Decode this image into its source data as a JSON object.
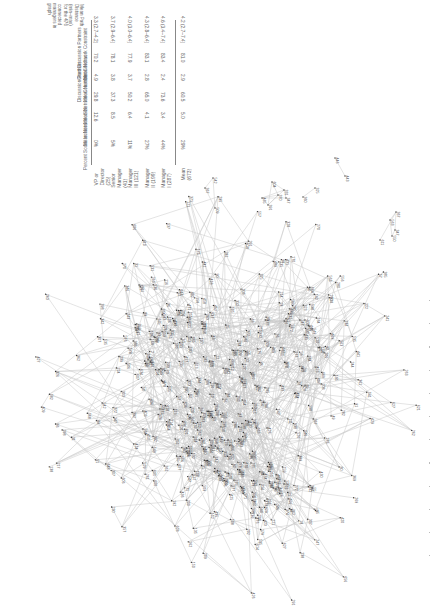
{
  "figure": {
    "orientation": "rotated-90-ccw",
    "table": {
      "columns": [
        "Percent Social Isolates",
        "Mean Network Size",
        "Mean Network Constraint",
        "Mean Number Cited as Discussion Partners",
        "Mean Network Constraint Cited Discussion Partners",
        "Mean Path Distance (min–max) for the 476 connected managers in graph"
      ],
      "column_lines": [
        [
          "Percent Social Isolates"
        ],
        [
          "Mean Network Size"
        ],
        [
          "Mean Network Constraint"
        ],
        [
          "Mean Number Cited as",
          "Discussion Partners"
        ],
        [
          "Mean Network Constraint",
          "Cited Discussion Partners"
        ],
        [
          "Mean Path",
          "Distance",
          "(min–max)",
          "for the 476",
          "connected",
          "managers in",
          "graph"
        ]
      ],
      "rows": [
        {
          "label": "VP or Director (25)",
          "values": [
            "0%",
            "12.6",
            "29.8",
            "4.9",
            "70.2",
            "3.3 (2.7–4.2)"
          ]
        },
        {
          "label": "Senior Manager (41)",
          "values": [
            "5%",
            "8.5",
            "37.3",
            "3.8",
            "78.1",
            "3.7 (2.9–6.4)"
          ]
        },
        {
          "label": "Manager III (121)",
          "values": [
            "11%",
            "6.4",
            "50.2",
            "3.7",
            "77.9",
            "4.0 (3.0–6.4)"
          ]
        },
        {
          "label": "Manager II (199)",
          "values": [
            "27%",
            "4.1",
            "65.0",
            "2.8",
            "83.1",
            "4.3 (2.8–6.4)"
          ]
        },
        {
          "label": "Manager I (287)",
          "values": [
            "44%",
            "3.4",
            "73.6",
            "2.4",
            "83.4",
            "4.6 (3.4–7.4)"
          ]
        },
        {
          "label": "Mean (673)",
          "values": [
            "29%",
            "5.0",
            "60.5",
            "2.9",
            "81.0",
            "4.2 (2.7–7.4)"
          ]
        }
      ]
    },
    "network": {
      "description": "Sociogram of discussion-partner network among connected managers",
      "connected_managers": 476,
      "edge_color": "#c8c8c8",
      "node_color": "#333333",
      "label_color": "#444444",
      "visible_isolated_pairs": [
        {
          "a": "446",
          "b": "443"
        },
        {
          "a": "325",
          "b": "360"
        }
      ],
      "sample_node_labels": [
        "318",
        "329",
        "344",
        "377",
        "370",
        "374",
        "390",
        "404",
        "414",
        "435",
        "462",
        "501",
        "513",
        "515",
        "518",
        "522",
        "540",
        "560",
        "567",
        "584",
        "594",
        "602",
        "607",
        "612",
        "614",
        "636",
        "664",
        "670",
        "671"
      ]
    }
  }
}
